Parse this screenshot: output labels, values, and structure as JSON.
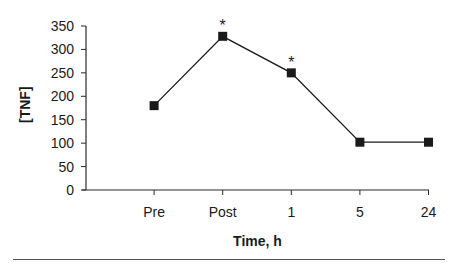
{
  "chart_data": {
    "type": "line",
    "title": "",
    "xlabel": "Time, h",
    "ylabel": "[TNF]",
    "categories": [
      "Pre",
      "Post",
      "1",
      "5",
      "24"
    ],
    "series": [
      {
        "name": "TNF",
        "values": [
          180,
          328,
          250,
          102,
          102
        ],
        "marker": "square",
        "color": "#1a1a1a"
      }
    ],
    "annotations": [
      {
        "category": "Post",
        "text": "*"
      },
      {
        "category": "1",
        "text": "*"
      }
    ],
    "ylim": [
      0,
      350
    ],
    "yticks": [
      0,
      50,
      100,
      150,
      200,
      250,
      300,
      350
    ],
    "grid": false,
    "legend": "none"
  }
}
